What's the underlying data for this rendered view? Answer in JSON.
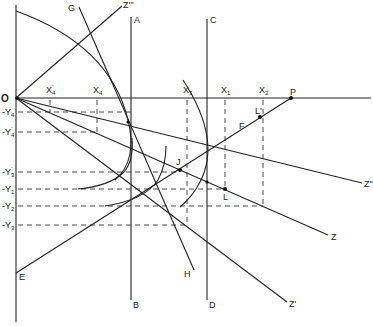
{
  "diagram": {
    "type": "geometric-construction",
    "origin_label": "O",
    "x_axis_labels": [
      {
        "id": "x4p",
        "text": "X",
        "sub": "4",
        "prime": "'",
        "x": 50
      },
      {
        "id": "x4",
        "text": "X",
        "sub": "4",
        "prime": "",
        "x": 97
      },
      {
        "id": "x3",
        "text": "X",
        "sub": "3",
        "prime": "",
        "x": 187
      },
      {
        "id": "x1",
        "text": "X",
        "sub": "1",
        "prime": "",
        "x": 225
      },
      {
        "id": "x2",
        "text": "X",
        "sub": "2",
        "prime": "",
        "x": 263
      }
    ],
    "y_axis_labels": [
      {
        "id": "y4",
        "text": "-Y",
        "sub": "4",
        "prime": "",
        "y": 112
      },
      {
        "id": "y4p",
        "text": "-Y",
        "sub": "4",
        "prime": "'",
        "y": 132
      },
      {
        "id": "y3p",
        "text": "-Y",
        "sub": "3",
        "prime": "'",
        "y": 172
      },
      {
        "id": "y1",
        "text": "-Y",
        "sub": "1",
        "prime": "",
        "y": 189
      },
      {
        "id": "y2",
        "text": "-Y",
        "sub": "2",
        "prime": "",
        "y": 206
      },
      {
        "id": "y3",
        "text": "-Y",
        "sub": "3",
        "prime": "",
        "y": 225
      }
    ],
    "point_labels": {
      "A": "A",
      "B": "B",
      "C": "C",
      "D": "D",
      "E": "E",
      "F": "F",
      "G": "G",
      "H": "H",
      "J": "J",
      "L": "L",
      "L_prime": "L'",
      "P": "P",
      "Z": "Z",
      "Z_prime": "Z'",
      "Z_double": "Z\"",
      "Z_triple": "Z'''"
    },
    "colors": {
      "line": "#222222",
      "background": "#ffffff"
    }
  }
}
